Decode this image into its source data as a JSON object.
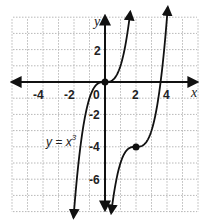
{
  "chart_data": {
    "type": "line",
    "title": "",
    "xlabel": "x",
    "ylabel": "y",
    "xlim": [
      -6,
      6
    ],
    "ylim": [
      -8,
      4
    ],
    "grid": true,
    "x_ticks": [
      "-4",
      "-2",
      "0",
      "2",
      "4"
    ],
    "y_ticks": [
      "2",
      "-2",
      "-4",
      "-6"
    ],
    "series": [
      {
        "name": "y = x^3",
        "label": "y = x",
        "label_exponent": "3",
        "function": "x^3",
        "points": [
          [
            -2,
            -8
          ],
          [
            -1.5,
            -3.375
          ],
          [
            -1,
            -1
          ],
          [
            0,
            0
          ],
          [
            1,
            1
          ],
          [
            1.5,
            3.375
          ],
          [
            1.65,
            4.5
          ]
        ],
        "marked_point": [
          0,
          0
        ]
      },
      {
        "name": "translated cube",
        "function": "(x-2)^3 - 4",
        "points": [
          [
            0.4,
            -8.1
          ],
          [
            1,
            -5
          ],
          [
            2,
            -4
          ],
          [
            3,
            -3
          ],
          [
            3.59,
            0
          ],
          [
            4,
            4
          ],
          [
            4.1,
            5.3
          ]
        ],
        "marked_point": [
          2,
          -4
        ]
      }
    ],
    "annotations": [
      {
        "text": "y = x³",
        "at": [
          -3,
          -4
        ]
      }
    ]
  },
  "labels": {
    "x_axis": "x",
    "y_axis": "y",
    "origin": "0",
    "eq_main": "y = x",
    "eq_exp": "3",
    "ticks_x": {
      "m4": "-4",
      "m2": "-2",
      "p2": "2",
      "p4": "4"
    },
    "ticks_y": {
      "p2": "2",
      "m2": "-2",
      "m4": "-4",
      "m6": "-6"
    }
  },
  "colors": {
    "curve": "#111111",
    "grid": "#b8b8b8",
    "axis": "#111111"
  }
}
